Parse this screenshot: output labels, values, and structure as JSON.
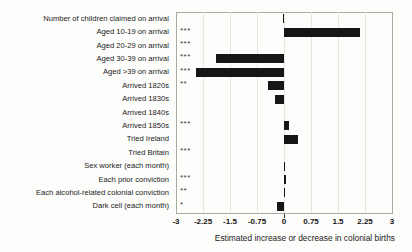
{
  "chart_data": {
    "type": "bar",
    "orientation": "horizontal",
    "title": "",
    "xlabel": "Estimated increase or decrease in colonial births",
    "xlim": [
      -3,
      3
    ],
    "xticks": [
      -3,
      -2.25,
      -1.5,
      -0.75,
      0,
      0.75,
      1.5,
      2.25,
      3
    ],
    "xtick_labels": [
      "-3",
      "-2.25",
      "-1.5",
      "-0.75",
      "0",
      "0.75",
      "1.5",
      "2.25",
      "3"
    ],
    "grid": true,
    "legend": "none",
    "bar_color": "#161616",
    "categories": [
      "Number of children claimed on arrival",
      "Aged 10-19 on arrival",
      "Aged 20-29 on arrival",
      "Aged 30-39 on arrival",
      "Aged >39 on arrival",
      "Arrived 1820s",
      "Arrived 1830s",
      "Arrived 1840s",
      "Arrived 1850s",
      "Tried Ireland",
      "Tried Britain",
      "Sex worker (each month)",
      "Each prior conviction",
      "Each alcohol-related colonial conviction",
      "Dark cell (each month)"
    ],
    "values": [
      -0.03,
      2.1,
      0,
      -1.9,
      -2.45,
      -0.45,
      -0.25,
      0,
      0.13,
      0.4,
      0,
      0.04,
      0.05,
      0.04,
      -0.2
    ],
    "significance": [
      "",
      "***",
      "***",
      "***",
      "***",
      "**",
      "",
      "",
      "***",
      "",
      "***",
      "",
      "***",
      "**",
      "*"
    ]
  },
  "colors": {
    "background": "#fdfdfb",
    "bar": "#161616",
    "plot_border": "#a9a9a3",
    "gridline": "#e7e7e2",
    "text": "#1b1b1b"
  }
}
